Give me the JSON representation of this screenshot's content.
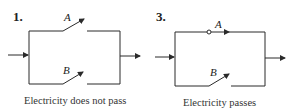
{
  "diagrams": [
    {
      "number": "1.",
      "switch_a_label": "A",
      "switch_b_label": "B",
      "switch_a_state": "open",
      "switch_b_state": "open",
      "caption": "Electricity does not pass"
    },
    {
      "number": "3.",
      "switch_a_label": "A",
      "switch_b_label": "B",
      "switch_a_state": "closed",
      "switch_b_state": "open",
      "caption": "Electricity passes"
    }
  ],
  "colors": {
    "line": "#2a2a2a",
    "background": "#ffffff"
  }
}
